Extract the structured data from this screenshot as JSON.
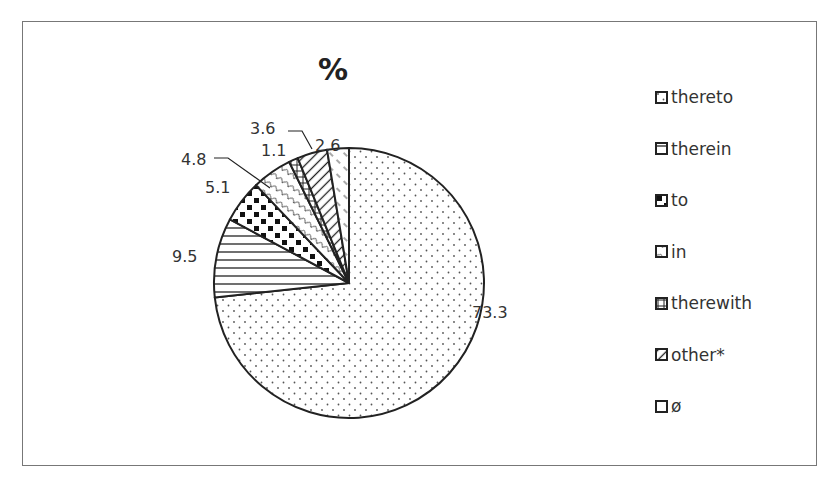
{
  "chart_data": {
    "type": "pie",
    "title": "%",
    "start_angle": "12 o'clock",
    "direction": "clockwise",
    "slices": [
      {
        "label": "thereto",
        "value": 73.3,
        "pattern": "dots"
      },
      {
        "label": "therein",
        "value": 9.5,
        "pattern": "horizontal-lines"
      },
      {
        "label": "to",
        "value": 5.1,
        "pattern": "checkerboard"
      },
      {
        "label": "in",
        "value": 4.8,
        "pattern": "scallops"
      },
      {
        "label": "therewith",
        "value": 1.1,
        "pattern": "grid"
      },
      {
        "label": "other*",
        "value": 3.6,
        "pattern": "diagonal-lines"
      },
      {
        "label": "ø",
        "value": 2.6,
        "pattern": "dashed-diagonal"
      }
    ],
    "data_labels": [
      "73.3",
      "9.5",
      "5.1",
      "4.8",
      "1.1",
      "3.6",
      "2.6"
    ],
    "legend": {
      "placement": "right",
      "entries": [
        "thereto",
        "therein",
        "to",
        "in",
        "therewith",
        "other*",
        "ø"
      ]
    },
    "colors": {
      "stroke": "#222222",
      "fill": "#ffffff",
      "text": "#333333"
    }
  }
}
